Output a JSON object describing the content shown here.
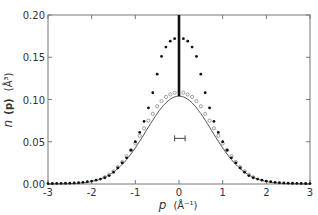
{
  "chart_data": {
    "type": "scatter",
    "title": "",
    "xlabel": "p (Å⁻¹)",
    "ylabel": "n (p) (Å³)",
    "xlabel_parts": {
      "var": "p",
      "unit": "(Å⁻¹)"
    },
    "ylabel_parts": {
      "var": "n",
      "arg": "(p)",
      "unit": "(Å³)"
    },
    "xlim": [
      -3,
      3
    ],
    "ylim": [
      0,
      0.2
    ],
    "xticks": [
      -3,
      -2,
      -1,
      0,
      1,
      2,
      3
    ],
    "xtick_labels": [
      "-3",
      "-2",
      "-1",
      "0",
      "1",
      "2",
      "3"
    ],
    "yticks": [
      0,
      0.05,
      0.1,
      0.15,
      0.2
    ],
    "ytick_labels": [
      "0.00",
      "0.05",
      "0.10",
      "0.15",
      "0.20"
    ],
    "grid": false,
    "legend": null,
    "series": [
      {
        "name": "filled-points",
        "marker": "filled-circle",
        "x": [
          -3.0,
          -2.9,
          -2.8,
          -2.7,
          -2.6,
          -2.5,
          -2.4,
          -2.3,
          -2.2,
          -2.1,
          -2.0,
          -1.9,
          -1.8,
          -1.7,
          -1.6,
          -1.5,
          -1.4,
          -1.3,
          -1.2,
          -1.1,
          -1.0,
          -0.9,
          -0.8,
          -0.7,
          -0.6,
          -0.5,
          -0.4,
          -0.3,
          -0.2,
          -0.1,
          0.1,
          0.2,
          0.3,
          0.4,
          0.5,
          0.6,
          0.7,
          0.8,
          0.9,
          1.0,
          1.1,
          1.2,
          1.3,
          1.4,
          1.5,
          1.6,
          1.7,
          1.8,
          1.9,
          2.0,
          2.1,
          2.2,
          2.3,
          2.4,
          2.5,
          2.6,
          2.7,
          2.8,
          2.9,
          3.0
        ],
        "y": [
          0.0005,
          0.0006,
          0.0007,
          0.0008,
          0.0009,
          0.001,
          0.0012,
          0.0015,
          0.002,
          0.0027,
          0.0035,
          0.0045,
          0.0058,
          0.0075,
          0.01,
          0.014,
          0.019,
          0.025,
          0.031,
          0.04,
          0.05,
          0.061,
          0.074,
          0.09,
          0.108,
          0.13,
          0.151,
          0.162,
          0.169,
          0.172,
          0.172,
          0.169,
          0.162,
          0.151,
          0.13,
          0.108,
          0.09,
          0.074,
          0.061,
          0.05,
          0.04,
          0.031,
          0.025,
          0.019,
          0.014,
          0.01,
          0.0075,
          0.0058,
          0.0045,
          0.0035,
          0.0027,
          0.002,
          0.0015,
          0.0012,
          0.001,
          0.0009,
          0.0008,
          0.0007,
          0.0006,
          0.0005
        ]
      },
      {
        "name": "open-points",
        "marker": "open-circle",
        "x": [
          -1.7,
          -1.6,
          -1.5,
          -1.4,
          -1.3,
          -1.2,
          -1.1,
          -1.0,
          -0.9,
          -0.8,
          -0.7,
          -0.6,
          -0.5,
          -0.4,
          -0.3,
          -0.2,
          -0.1,
          0.1,
          0.2,
          0.3,
          0.4,
          0.5,
          0.6,
          0.7,
          0.8,
          0.9,
          1.0,
          1.1,
          1.2,
          1.3,
          1.4,
          1.5,
          1.6,
          1.7
        ],
        "y": [
          0.008,
          0.011,
          0.015,
          0.02,
          0.026,
          0.033,
          0.04,
          0.048,
          0.057,
          0.066,
          0.075,
          0.083,
          0.092,
          0.098,
          0.103,
          0.106,
          0.108,
          0.108,
          0.106,
          0.103,
          0.098,
          0.092,
          0.083,
          0.075,
          0.066,
          0.057,
          0.048,
          0.04,
          0.033,
          0.026,
          0.02,
          0.015,
          0.011,
          0.008
        ]
      },
      {
        "name": "gaussian-curve",
        "marker": "line",
        "peak": 0.104,
        "sigma": 0.75,
        "center": 0
      },
      {
        "name": "delta-spike",
        "marker": "heavy-vertical-line",
        "x": 0,
        "y_from": 0.104,
        "y_to": 0.2
      }
    ],
    "annotations": [
      {
        "type": "error-bar",
        "x_from": -0.1,
        "x_to": 0.14,
        "y": 0.054
      }
    ]
  }
}
